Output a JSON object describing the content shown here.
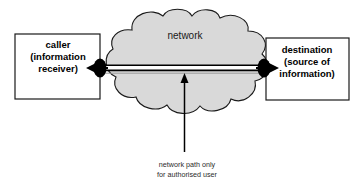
{
  "diagram": {
    "title": "network path only for authorised user",
    "background": "#ffffff",
    "colors": {
      "cloud_fill": "#d9d9d9",
      "cloud_stroke": "#1a1a1a",
      "box_stroke": "#1a1a1a",
      "box_fill": "#ffffff",
      "line": "#000000",
      "node": "#000000",
      "text": "#000000"
    },
    "cloud": {
      "label": "network"
    },
    "caller_box": {
      "line1": "caller",
      "line2": "(information",
      "line3": "receiver)"
    },
    "destination_box": {
      "line1": "destination",
      "line2": "(source of",
      "line3": "information)"
    },
    "caption": {
      "line1": "network path only",
      "line2": "for authorised user"
    },
    "connector": {
      "type": "bidirectional-path",
      "left_endpoint": "caller",
      "right_endpoint": "destination",
      "left_arrow_direction": "left",
      "right_arrow_direction": "right"
    },
    "pointer_arrow": {
      "direction": "up",
      "points_to": "network path"
    }
  }
}
